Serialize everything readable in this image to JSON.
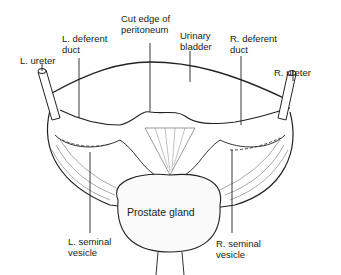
{
  "diagram": {
    "labels": {
      "l_ureter": "L. ureter",
      "l_deferent_duct": "L. deferent\nduct",
      "cut_edge": "Cut edge of\nperitoneum",
      "urinary_bladder": "Urinary\nbladder",
      "r_deferent_duct": "R. deferent\nduct",
      "r_ureter": "R. ureter",
      "prostate_gland": "Prostate gland",
      "l_seminal_vesicle": "L. seminal\nvesicle",
      "r_seminal_vesicle": "R. seminal\nvesicle"
    },
    "colors": {
      "line": "#222222",
      "fill": "#ffffff",
      "shade": "#cfcfcf"
    }
  }
}
